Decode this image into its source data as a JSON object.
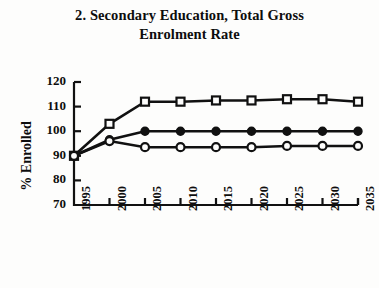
{
  "chart_data": {
    "type": "line",
    "title": "2. Secondary Education, Total Gross Enrolment Rate",
    "title_line_1": "2. Secondary Education, Total Gross",
    "title_line_2": "Enrolment Rate",
    "xlabel": "Year",
    "ylabel": "% Enrolled",
    "x": [
      1995,
      2000,
      2005,
      2010,
      2015,
      2020,
      2025,
      2030,
      2035
    ],
    "xtick_labels": [
      "1995",
      "2000",
      "2005",
      "2010",
      "2015",
      "2020",
      "2025",
      "2030",
      "2035"
    ],
    "ytick_labels": [
      "120",
      "110",
      "100",
      "90",
      "80",
      "70"
    ],
    "yticks": [
      120,
      110,
      100,
      90,
      80,
      70
    ],
    "xlim": [
      1995,
      2035
    ],
    "ylim": [
      70,
      120
    ],
    "grid": false,
    "legend": "none",
    "series": [
      {
        "name": "Open squares",
        "marker": "open-square",
        "color": "#111111",
        "values": [
          90,
          103,
          112,
          112,
          112.5,
          112.5,
          113,
          113,
          112
        ]
      },
      {
        "name": "Filled circles",
        "marker": "filled-circle",
        "color": "#111111",
        "values": [
          90,
          96.5,
          100,
          100,
          100,
          100,
          100,
          100,
          100
        ]
      },
      {
        "name": "Open circles",
        "marker": "open-circle",
        "color": "#111111",
        "values": [
          90,
          96,
          93.5,
          93.5,
          93.5,
          93.5,
          94,
          94,
          94
        ]
      }
    ]
  }
}
